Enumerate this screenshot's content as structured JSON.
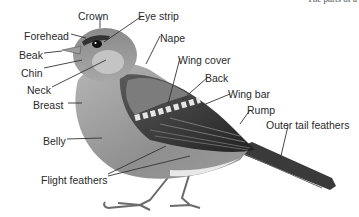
{
  "corner_text": "The parts of a",
  "diagram": {
    "labels": [
      {
        "id": "crown",
        "text": "Crown",
        "x": 78,
        "y": 11
      },
      {
        "id": "eye-strip",
        "text": "Eye strip",
        "x": 138,
        "y": 11
      },
      {
        "id": "forehead",
        "text": "Forehead",
        "x": 24,
        "y": 31
      },
      {
        "id": "nape",
        "text": "Nape",
        "x": 160,
        "y": 33
      },
      {
        "id": "beak",
        "text": "Beak",
        "x": 19,
        "y": 50
      },
      {
        "id": "wing-cover",
        "text": "Wing cover",
        "x": 178,
        "y": 55
      },
      {
        "id": "chin",
        "text": "Chin",
        "x": 21,
        "y": 68
      },
      {
        "id": "back",
        "text": "Back",
        "x": 205,
        "y": 73
      },
      {
        "id": "neck",
        "text": "Neck",
        "x": 27,
        "y": 85
      },
      {
        "id": "wing-bar",
        "text": "Wing bar",
        "x": 228,
        "y": 89
      },
      {
        "id": "breast",
        "text": "Breast",
        "x": 33,
        "y": 100
      },
      {
        "id": "rump",
        "text": "Rump",
        "x": 247,
        "y": 105
      },
      {
        "id": "outer-tail-feathers",
        "text": "Outer tail feathers",
        "x": 266,
        "y": 120
      },
      {
        "id": "belly",
        "text": "Belly",
        "x": 43,
        "y": 136
      },
      {
        "id": "flight-feathers",
        "text": "Flight feathers",
        "x": 41,
        "y": 175
      }
    ]
  }
}
